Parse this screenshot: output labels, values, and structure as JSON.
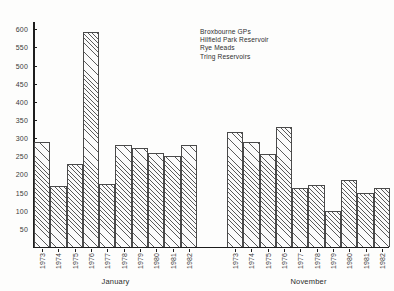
{
  "chart_data": {
    "type": "bar",
    "title": "",
    "xlabel": "",
    "ylabel": "",
    "ylim": [
      0,
      620
    ],
    "yticks": [
      50,
      100,
      150,
      200,
      250,
      300,
      350,
      400,
      450,
      500,
      550,
      600
    ],
    "grid": false,
    "legend_position": "top-center",
    "legend": [
      "Broxbourne GPs",
      "Hilfield Park Reservoir",
      "Rye Meads",
      "Tring Reservoirs"
    ],
    "panels": [
      {
        "label": "January",
        "categories": [
          "1973",
          "1974",
          "1975",
          "1976",
          "1977",
          "1978",
          "1979",
          "1980",
          "1981",
          "1982"
        ],
        "values": [
          290,
          168,
          228,
          592,
          175,
          280,
          273,
          258,
          252,
          282
        ]
      },
      {
        "label": "November",
        "categories": [
          "1973",
          "1974",
          "1975",
          "1976",
          "1977",
          "1978",
          "1979",
          "1980",
          "1981",
          "1982"
        ],
        "values": [
          317,
          288,
          255,
          330,
          162,
          170,
          98,
          185,
          148,
          163
        ]
      }
    ]
  }
}
